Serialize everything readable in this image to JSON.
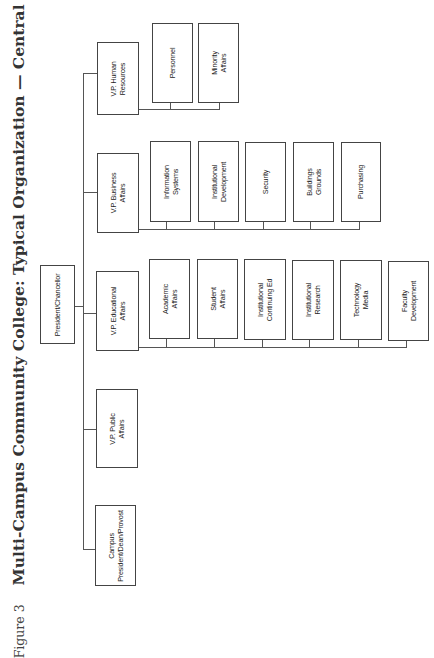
{
  "title": {
    "figure_label": "Figure 3",
    "text": "Multi-Campus Community College: Typical Organization — Central Office"
  },
  "org_chart": {
    "root": "President/Chancellor",
    "vice_presidents": [
      {
        "label": "V.P. Human Resources",
        "children": [
          "Personnel",
          "Minority Affairs"
        ]
      },
      {
        "label": "V.P. Business Affairs",
        "children": [
          "Information Systems",
          "Institutional Development",
          "Security",
          "Buildings Grounds",
          "Purchasing"
        ]
      },
      {
        "label": "V.P. Educational Affairs",
        "children": [
          "Academic Affairs",
          "Student Affairs",
          "Institutional Continuing Ed",
          "Institutional Research",
          "Technology Media",
          "Faculty Development"
        ]
      },
      {
        "label": "V.P. Public Affairs",
        "children": []
      },
      {
        "label": "Campus President/Dean/Provost",
        "children": []
      }
    ]
  },
  "labels": {
    "root": "President/Chancellor",
    "vp_hr_1": "V.P. Human",
    "vp_hr_2": "Resources",
    "vp_bus_1": "V.P. Business",
    "vp_bus_2": "Affairs",
    "vp_edu_1": "V.P. Educational",
    "vp_edu_2": "Affairs",
    "vp_pub_1": "V.P. Public",
    "vp_pub_2": "Affairs",
    "campus_1": "Campus",
    "campus_2": "President/Dean/Provost",
    "hr_personnel": "Personnel",
    "hr_minority_1": "Minority",
    "hr_minority_2": "Affairs",
    "bus_info_1": "Information",
    "bus_info_2": "Systems",
    "bus_dev_1": "Institutional",
    "bus_dev_2": "Development",
    "bus_security": "Security",
    "bus_build_1": "Buildings",
    "bus_build_2": "Grounds",
    "bus_purchasing": "Purchasing",
    "edu_acad_1": "Academic",
    "edu_acad_2": "Affairs",
    "edu_student_1": "Student",
    "edu_student_2": "Affairs",
    "edu_cont_1": "Institutional",
    "edu_cont_2": "Continuing Ed",
    "edu_research_1": "Institutional",
    "edu_research_2": "Research",
    "edu_tech_1": "Technology",
    "edu_tech_2": "Media",
    "edu_faculty_1": "Faculty",
    "edu_faculty_2": "Development"
  }
}
